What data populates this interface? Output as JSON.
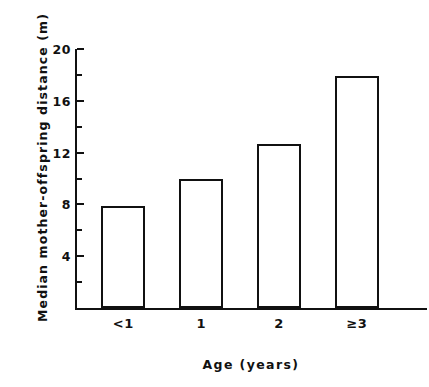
{
  "chart_data": {
    "type": "bar",
    "title": "",
    "subtitle": "",
    "xlabel": "Age  (years)",
    "ylabel": "Median  mother-offspring  distance (m)",
    "categories": [
      "<1",
      "1",
      "2",
      "≥3"
    ],
    "values": [
      7.9,
      10.0,
      12.7,
      17.9
    ],
    "series": [
      {
        "name": "Median mother-offspring distance",
        "values": [
          7.9,
          10.0,
          12.7,
          17.9
        ]
      }
    ],
    "ylim": [
      0,
      20
    ],
    "xlim": [
      0,
      4
    ],
    "y_major_ticks": [
      4,
      8,
      12,
      16,
      20
    ],
    "y_major_tick_labels": [
      "4",
      "8",
      "12",
      "16",
      "20"
    ],
    "y_minor_ticks": [
      2,
      6,
      10,
      14,
      18
    ],
    "grid": false,
    "legend": null,
    "legend_position": "none",
    "bar_facecolor": "#ffffff",
    "bar_edgecolor": "#111111",
    "axis_color": "#111111",
    "background_color": "#ffffff"
  }
}
